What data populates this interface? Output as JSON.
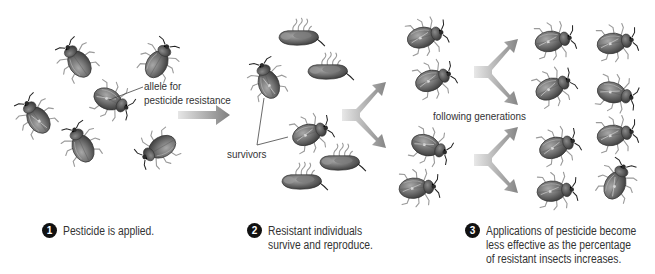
{
  "diagram": {
    "labels": {
      "allele_line1": "allele for",
      "allele_line2": "pesticide resistance",
      "survivors": "survivors",
      "following_generations": "following generations"
    },
    "steps": [
      {
        "number": "1",
        "lines": [
          "Pesticide is applied."
        ]
      },
      {
        "number": "2",
        "lines": [
          "Resistant individuals",
          "survive and reproduce."
        ]
      },
      {
        "number": "3",
        "lines": [
          "Applications of pesticide become",
          "less effective as the percentage",
          "of resistant insects increases."
        ]
      }
    ],
    "icons": {
      "insect": "beetle-icon",
      "dead_insect": "dead-beetle-icon",
      "arrow": "arrow-right-icon",
      "branch_arrow": "fork-arrow-icon"
    },
    "colors": {
      "beetle_body": "#6e6e6e",
      "beetle_dark": "#3a3a3a",
      "arrow_gray": "#8f8f8f",
      "text": "#333333",
      "badge": "#111111"
    },
    "populations": {
      "initial_insects": 7,
      "resistant_in_initial": 1,
      "dead_after_pesticide": 5,
      "survivors": 2,
      "second_generation": 4,
      "later_generations": 8
    }
  }
}
